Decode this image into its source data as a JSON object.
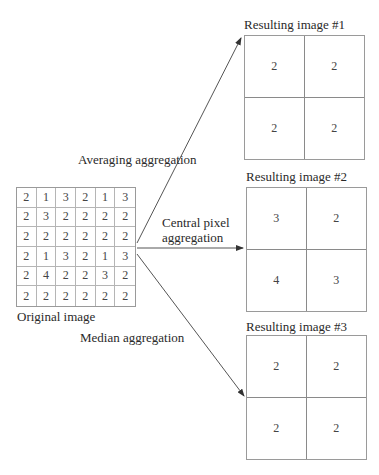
{
  "original": {
    "caption": "Original image",
    "rows": [
      [
        "2",
        "1",
        "3",
        "2",
        "1",
        "3"
      ],
      [
        "2",
        "3",
        "2",
        "2",
        "2",
        "2"
      ],
      [
        "2",
        "2",
        "2",
        "2",
        "2",
        "2"
      ],
      [
        "2",
        "1",
        "3",
        "2",
        "1",
        "3"
      ],
      [
        "2",
        "4",
        "2",
        "2",
        "3",
        "2"
      ],
      [
        "2",
        "2",
        "2",
        "2",
        "2",
        "2"
      ]
    ]
  },
  "arrows": {
    "averaging": "Averaging aggregation",
    "central_line1": "Central pixel",
    "central_line2": "aggregation",
    "median": "Median aggregation"
  },
  "results": [
    {
      "title": "Resulting image #1",
      "cells": [
        "2",
        "2",
        "2",
        "2"
      ]
    },
    {
      "title": "Resulting image #2",
      "cells": [
        "3",
        "2",
        "4",
        "3"
      ]
    },
    {
      "title": "Resulting image #3",
      "cells": [
        "2",
        "2",
        "2",
        "2"
      ]
    }
  ],
  "colors": {
    "line": "#555555",
    "grid": "#9a9a9a",
    "text": "#2a2a2a"
  }
}
